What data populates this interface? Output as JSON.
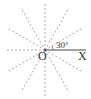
{
  "diagram": {
    "type": "angle-rays",
    "center": {
      "label": "O",
      "x": 45,
      "y": 50
    },
    "ray_end": {
      "label": "X",
      "x": 84,
      "y": 50
    },
    "angle_label": "30°",
    "ray_interval_deg": 30,
    "ray_count": 12,
    "colors": {
      "solid": "#444444",
      "dashed": "#aaaaaa",
      "text": "#333333"
    }
  }
}
